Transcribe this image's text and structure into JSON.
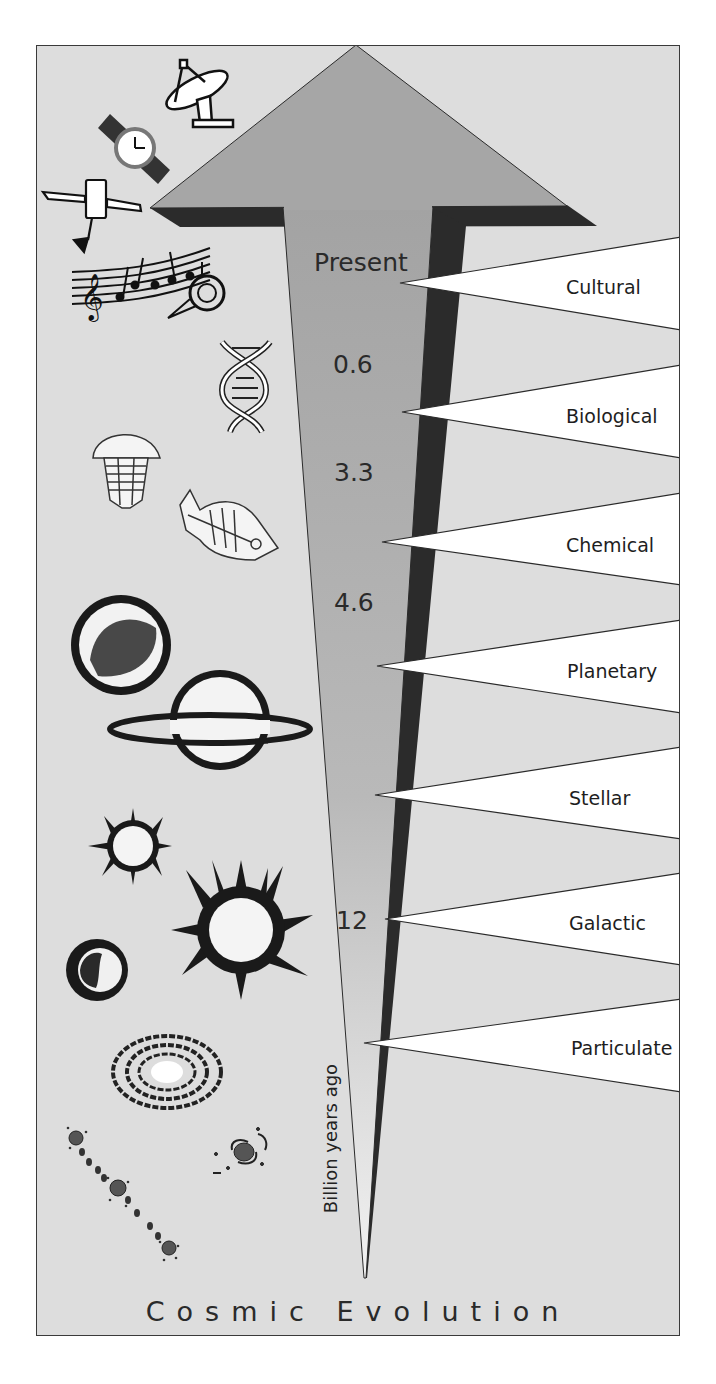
{
  "title": "Cosmic Evolution",
  "axis_label": "Billion years ago",
  "time_marks": [
    {
      "label": "Present"
    },
    {
      "label": "0.6"
    },
    {
      "label": "3.3"
    },
    {
      "label": "4.6"
    },
    {
      "label": "12"
    }
  ],
  "eras": [
    {
      "label": "Cultural"
    },
    {
      "label": "Biological"
    },
    {
      "label": "Chemical"
    },
    {
      "label": "Planetary"
    },
    {
      "label": "Stellar"
    },
    {
      "label": "Galactic"
    },
    {
      "label": "Particulate"
    }
  ],
  "icons": [
    {
      "name": "radio-telescope-icon",
      "era": "Cultural"
    },
    {
      "name": "wristwatch-icon",
      "era": "Cultural"
    },
    {
      "name": "satellite-icon",
      "era": "Cultural"
    },
    {
      "name": "music-and-horn-icon",
      "era": "Cultural"
    },
    {
      "name": "dna-helix-icon",
      "era": "Biological"
    },
    {
      "name": "trilobite-icon",
      "era": "Biological"
    },
    {
      "name": "fish-fossil-icon",
      "era": "Biological"
    },
    {
      "name": "planet-icon",
      "era": "Planetary"
    },
    {
      "name": "ringed-planet-icon",
      "era": "Planetary"
    },
    {
      "name": "small-star-icon",
      "era": "Stellar"
    },
    {
      "name": "large-star-icon",
      "era": "Stellar"
    },
    {
      "name": "dark-planet-icon",
      "era": "Stellar"
    },
    {
      "name": "spiral-galaxy-icon",
      "era": "Galactic"
    },
    {
      "name": "small-galaxy-icon",
      "era": "Galactic"
    },
    {
      "name": "particle-chain-icon",
      "era": "Particulate"
    }
  ],
  "colors": {
    "background": "#dddddd",
    "arrow_gray": "#a6a6a6",
    "arrow_shadow": "#2b2b2b",
    "wedge_fill": "#ffffff",
    "outline": "#2a2a2a"
  }
}
